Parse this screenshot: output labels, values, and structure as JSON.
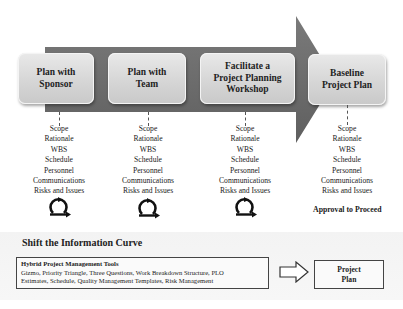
{
  "stages": [
    {
      "label": "Plan with\nSponsor"
    },
    {
      "label": "Plan with\nTeam"
    },
    {
      "label": "Facilitate a\nProject Planning\nWorkshop"
    },
    {
      "label": "Baseline\nProject Plan"
    }
  ],
  "deliverables": {
    "items": [
      "Scope",
      "Rationale",
      "WBS",
      "Schedule",
      "Personnel",
      "Communications",
      "Risks and Issues"
    ]
  },
  "cycle_icon": "iterate-cycle-icon",
  "approval_label": "Approval to Proceed",
  "bottom": {
    "title": "Shift the Information Curve",
    "tools_box": {
      "title": "Hybrid Project Management Tools",
      "line1": "Gizmo, Priority Triangle, Three Questions, Work Breakdown Structure, PLO",
      "line2": "Estimates, Schedule, Quality Management Templates, Risk Management"
    },
    "arrow_icon": "hollow-right-arrow-icon",
    "result_box": {
      "label": "Project\nPlan"
    }
  },
  "colors": {
    "arrow": "#6e6e6e",
    "box_fill": "#d9d9d9",
    "text": "#222222"
  }
}
